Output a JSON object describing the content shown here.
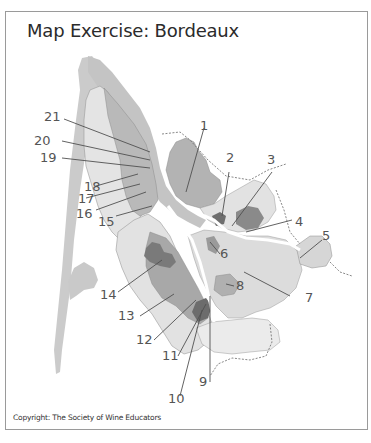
{
  "title": "Map Exercise: Bordeaux",
  "copyright": "Copyright: The Society of Wine Educators",
  "map": {
    "region": "Bordeaux",
    "colors": {
      "water": "#c9c9c9",
      "light_region": "#e6e6e6",
      "mid_region": "#b9b9b9",
      "mid_dark_region": "#a3a3a3",
      "dark_region": "#7c7c7c",
      "leader_line": "#505050",
      "label_text": "#555555",
      "boundary_dashed": "#6a6a6a"
    },
    "labels": [
      {
        "id": "1",
        "text": "1"
      },
      {
        "id": "2",
        "text": "2"
      },
      {
        "id": "3",
        "text": "3"
      },
      {
        "id": "4",
        "text": "4"
      },
      {
        "id": "5",
        "text": "5"
      },
      {
        "id": "6",
        "text": "6"
      },
      {
        "id": "7",
        "text": "7"
      },
      {
        "id": "8",
        "text": "8"
      },
      {
        "id": "9",
        "text": "9"
      },
      {
        "id": "10",
        "text": "10"
      },
      {
        "id": "11",
        "text": "11"
      },
      {
        "id": "12",
        "text": "12"
      },
      {
        "id": "13",
        "text": "13"
      },
      {
        "id": "14",
        "text": "14"
      },
      {
        "id": "15",
        "text": "15"
      },
      {
        "id": "16",
        "text": "16"
      },
      {
        "id": "17",
        "text": "17"
      },
      {
        "id": "18",
        "text": "18"
      },
      {
        "id": "19",
        "text": "19"
      },
      {
        "id": "20",
        "text": "20"
      },
      {
        "id": "21",
        "text": "21"
      }
    ]
  }
}
